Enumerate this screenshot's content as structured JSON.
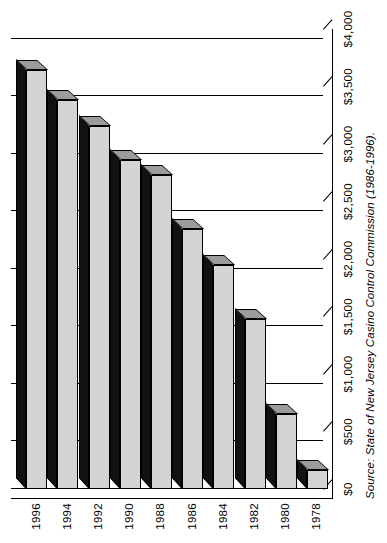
{
  "chart_data": {
    "type": "bar",
    "orientation": "horizontal",
    "title": "",
    "subtitle": "",
    "xlabel": "",
    "ylabel": "",
    "categories": [
      "1978",
      "1980",
      "1982",
      "1984",
      "1986",
      "1988",
      "1990",
      "1992",
      "1994",
      "1996"
    ],
    "values": [
      168,
      655,
      1480,
      1946,
      2263,
      2730,
      2859,
      3155,
      3384,
      3646
    ],
    "value_tick_labels": [
      "$0",
      "$500",
      "$1,000",
      "$1,500",
      "$2,000",
      "$2,500",
      "$3,000",
      "$3,500",
      "$4,000"
    ],
    "value_ticks": [
      0,
      500,
      1000,
      1500,
      2000,
      2500,
      3000,
      3500,
      4000
    ],
    "xlim": [
      0,
      4000
    ],
    "grid": true,
    "legend": false,
    "legend_position": "none",
    "style": "3d-bar",
    "annotations": [
      "Source: State of New Jersey Casino Control Commission (1986-1996)."
    ]
  },
  "figure": {
    "source_note": "Source: State of New Jersey Casino Control Commission (1986-1996)."
  },
  "colors": {
    "bar_face": "#d4d4d4",
    "bar_top": "#111111",
    "bar_cap": "#9c9c9c",
    "axis": "#000000",
    "background": "#ffffff"
  }
}
